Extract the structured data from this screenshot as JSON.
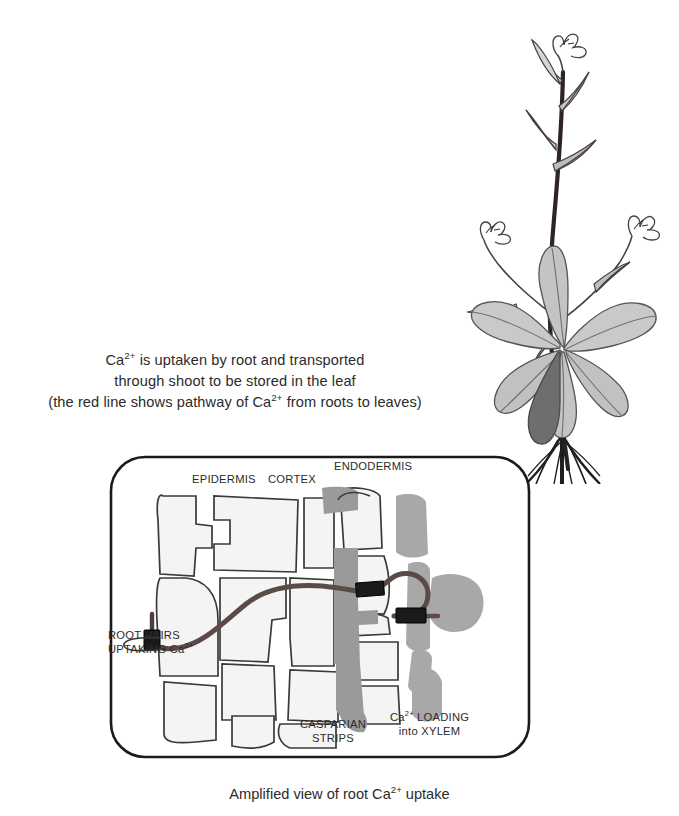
{
  "figure": {
    "intro_lines": [
      "Ca2+ is uptaken by root and transported",
      "through shoot to be stored in the leaf",
      "(the red line shows pathway of Ca2+ from roots to leaves)"
    ],
    "caption": "Amplified view of root Ca2+ uptake",
    "diagram_labels": {
      "epidermis": "EPIDERMIS",
      "cortex": "CORTEX",
      "endodermis": "ENDODERMIS",
      "root_hairs_line1": "ROOT HAIRS",
      "root_hairs_line2": "UPTAKING Ca2+",
      "casparian_line1": "CASPARIAN",
      "casparian_line2": "STRIPS",
      "xylem_line1": "Ca2+ LOADING",
      "xylem_line2": "into XYLEM"
    },
    "colors": {
      "pathway_line": "#5c4a49",
      "transporter_block": "#1a1a1a",
      "cell_fill": "#f4f4f4",
      "cell_stroke": "#3a3a3a",
      "casparian_fill": "#9a9a9a",
      "xylem_fill": "#a8a8a8",
      "box_stroke": "#1a1a1a",
      "plant_stem": "#2e2424",
      "plant_leaf_light": "#c9c9c9",
      "plant_leaf_dark": "#6e6e6e",
      "plant_root": "#1f1f1f",
      "text": "#2b2b2b"
    }
  }
}
